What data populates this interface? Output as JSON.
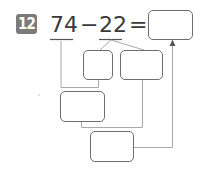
{
  "problem": {
    "number": "12",
    "operand1": "74",
    "operator": "−",
    "operand2": "22",
    "equals": "=",
    "answer_value": ""
  },
  "boxes": [
    {
      "id": "answer",
      "value": ""
    },
    {
      "id": "split-a",
      "value": ""
    },
    {
      "id": "split-b",
      "value": ""
    },
    {
      "id": "partial-result",
      "value": ""
    },
    {
      "id": "final-step",
      "value": ""
    }
  ],
  "colors": {
    "badge": "#7b7b7b",
    "line": "#a8a8a8",
    "box_border": "#6e6e6e",
    "text": "#3a3a3a"
  }
}
